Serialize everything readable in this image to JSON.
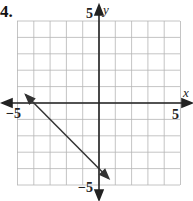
{
  "problem": {
    "number": "4."
  },
  "chart_data": {
    "type": "line",
    "title": "",
    "xlabel": "x",
    "ylabel": "y",
    "xlim": [
      -5,
      5
    ],
    "ylim": [
      -5,
      5
    ],
    "grid": true,
    "tick_labels": {
      "x": [
        "-5",
        "5"
      ],
      "y": [
        "5",
        "-5"
      ]
    },
    "series": [
      {
        "name": "line",
        "equation": "y = -x - 4",
        "x": [
          -4.5,
          -4,
          0,
          0.6
        ],
        "y": [
          0.5,
          0,
          -4,
          -4.6
        ],
        "arrows": "both"
      }
    ]
  },
  "labels": {
    "x_axis": "x",
    "y_axis": "y",
    "x_min": "−5",
    "x_max": "5",
    "y_max": "5",
    "y_min": "−5"
  }
}
